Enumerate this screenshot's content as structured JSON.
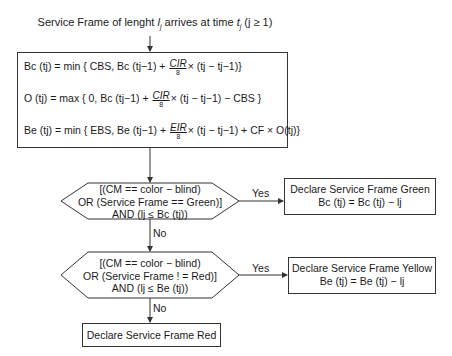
{
  "title": {
    "prefix": "Service Frame of lenght ",
    "l": "l",
    "l_sub": "j",
    "mid": " arrives at time ",
    "t": "t",
    "t_sub": "j",
    "suffix": " (j ≥ 1)"
  },
  "formulas": {
    "bc": {
      "lhs": "Bc (tj) = min { CBS, Bc (tj−1) + ",
      "frac_num": "CIR",
      "frac_den": "8",
      "rhs": "× (tj − tj−1)}"
    },
    "o": {
      "lhs": "O (tj) = max { 0, Bc (tj−1) + ",
      "frac_num": "CIR",
      "frac_den": "8",
      "rhs": "× (tj − tj−1) − CBS }"
    },
    "be": {
      "lhs": "Be (tj) = min { EBS, Be (tj−1) + ",
      "frac_num": "EIR",
      "frac_den": "8",
      "rhs": "× (tj − tj−1) + CF × O(tj)}"
    }
  },
  "decision1": {
    "line1": "[(CM == color − blind)",
    "line2": "OR (Service Frame == Green)]",
    "line3": "AND (lj ≤ Bc (tj))"
  },
  "decision2": {
    "line1": "[(CM == color − blind)",
    "line2": "OR (Service Frame ! = Red)]",
    "line3": "AND (lj ≤ Be (tj))"
  },
  "green_box": {
    "line1": "Declare Service Frame Green",
    "line2": "Bc (tj) = Bc (tj) − lj"
  },
  "yellow_box": {
    "line1": "Declare Service Frame Yellow",
    "line2": "Be (tj) = Be (tj) − lj"
  },
  "red_box": {
    "line1": "Declare Service Frame Red"
  },
  "edges": {
    "yes1": "Yes",
    "no1": "No",
    "yes2": "Yes",
    "no2": "No"
  }
}
